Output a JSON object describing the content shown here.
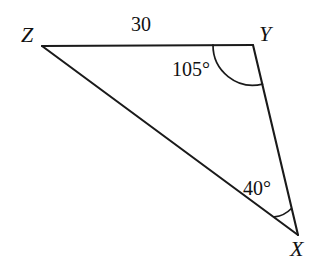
{
  "figure": {
    "kind": "triangle-diagram",
    "background_color": "#ffffff",
    "stroke_color": "#1a1a1a",
    "vertices": [
      {
        "id": "Z",
        "label": "Z",
        "x": 42,
        "y": 46
      },
      {
        "id": "Y",
        "label": "Y",
        "x": 253,
        "y": 45
      },
      {
        "id": "X",
        "label": "X",
        "x": 298,
        "y": 235
      }
    ],
    "sides": [
      {
        "id": "ZY",
        "from": "Z",
        "to": "Y",
        "label": "30"
      },
      {
        "id": "YX",
        "from": "Y",
        "to": "X",
        "label": ""
      },
      {
        "id": "ZX",
        "from": "Z",
        "to": "X",
        "label": ""
      }
    ],
    "angles": [
      {
        "at": "Y",
        "label": "105°",
        "value": 105,
        "arc": "large"
      },
      {
        "at": "X",
        "label": "40°",
        "value": 40,
        "arc": "small"
      }
    ],
    "labels": {
      "vertex_z": "Z",
      "vertex_y": "Y",
      "vertex_x": "X",
      "side_zy": "30",
      "angle_y": "105°",
      "angle_x": "40°"
    }
  }
}
